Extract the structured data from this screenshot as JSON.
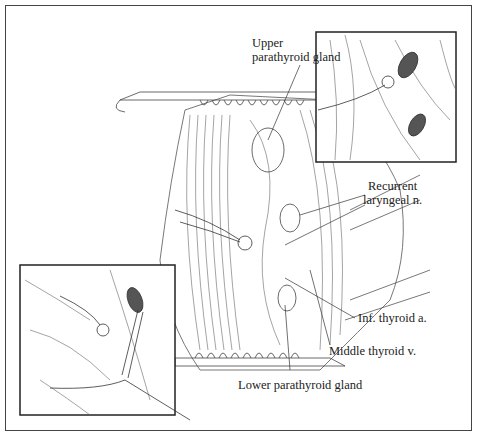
{
  "figure": {
    "type": "surgical line illustration",
    "labels": {
      "upper_parathyroid_l1": "Upper",
      "upper_parathyroid_l2": "parathyroid gland",
      "recurrent_l1": "Recurrent",
      "recurrent_l2": "laryngeal n.",
      "inf_thyroid": "Inf. thyroid a.",
      "middle_thyroid": "Middle thyroid v.",
      "lower_parathyroid": "Lower parathyroid gland"
    },
    "insets": [
      {
        "position": "top-right",
        "content": "close-up of upper parathyroid gland"
      },
      {
        "position": "bottom-left",
        "content": "close-up of forceps dissection of lower parathyroid gland"
      }
    ]
  }
}
